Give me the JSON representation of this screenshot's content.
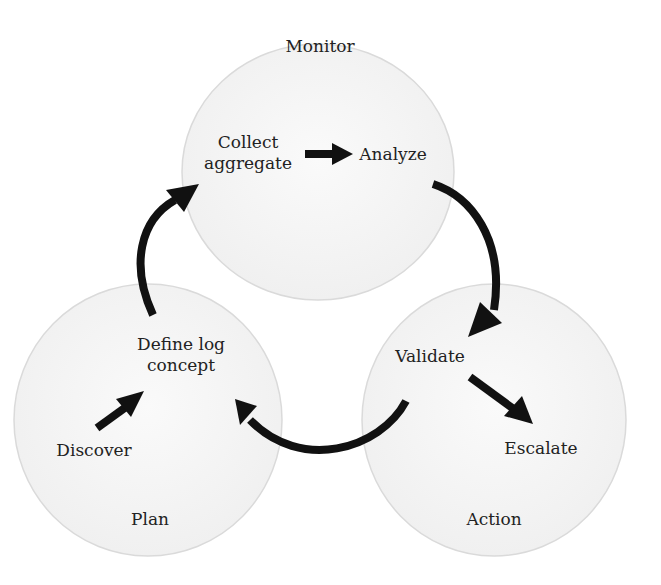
{
  "diagram": {
    "type": "cycle",
    "colors": {
      "circle_fill": "#f3f3f3",
      "circle_edge": "#d6d6d6",
      "arrow": "#111111",
      "text": "#222222"
    },
    "circles": [
      {
        "id": "monitor",
        "title": "Monitor",
        "cx": 318,
        "cy": 172,
        "rx": 136,
        "ry": 128
      },
      {
        "id": "plan",
        "title": "Plan",
        "cx": 148,
        "cy": 420,
        "rx": 134,
        "ry": 136
      },
      {
        "id": "action",
        "title": "Action",
        "cx": 494,
        "cy": 420,
        "rx": 132,
        "ry": 136
      }
    ],
    "nodes": {
      "collect_aggregate": "Collect\naggregate",
      "analyze": "Analyze",
      "validate": "Validate",
      "escalate": "Escalate",
      "define_log_concept": "Define log\nconcept",
      "discover": "Discover"
    },
    "edges": [
      {
        "from": "Collect aggregate",
        "to": "Analyze",
        "style": "straight"
      },
      {
        "from": "Analyze",
        "to": "Validate",
        "style": "curved"
      },
      {
        "from": "Validate",
        "to": "Escalate",
        "style": "straight"
      },
      {
        "from": "Validate",
        "to": "Define log concept",
        "style": "curved"
      },
      {
        "from": "Discover",
        "to": "Define log concept",
        "style": "straight"
      },
      {
        "from": "Define log concept",
        "to": "Collect aggregate",
        "style": "curved"
      }
    ]
  }
}
